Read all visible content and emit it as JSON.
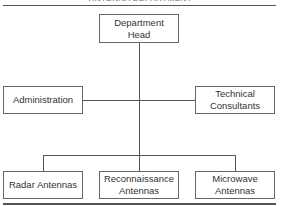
{
  "header": {
    "clipped_title": "ANTENNA DEPARTMENT"
  },
  "org_chart": {
    "root": {
      "label": "Department\nHead"
    },
    "staff": [
      {
        "label": "Administration"
      },
      {
        "label": "Technical\nConsultants"
      }
    ],
    "subordinates": [
      {
        "label": "Radar Antennas"
      },
      {
        "label": "Reconnaissance\nAntennas"
      },
      {
        "label": "Microwave\nAntennas"
      }
    ]
  }
}
